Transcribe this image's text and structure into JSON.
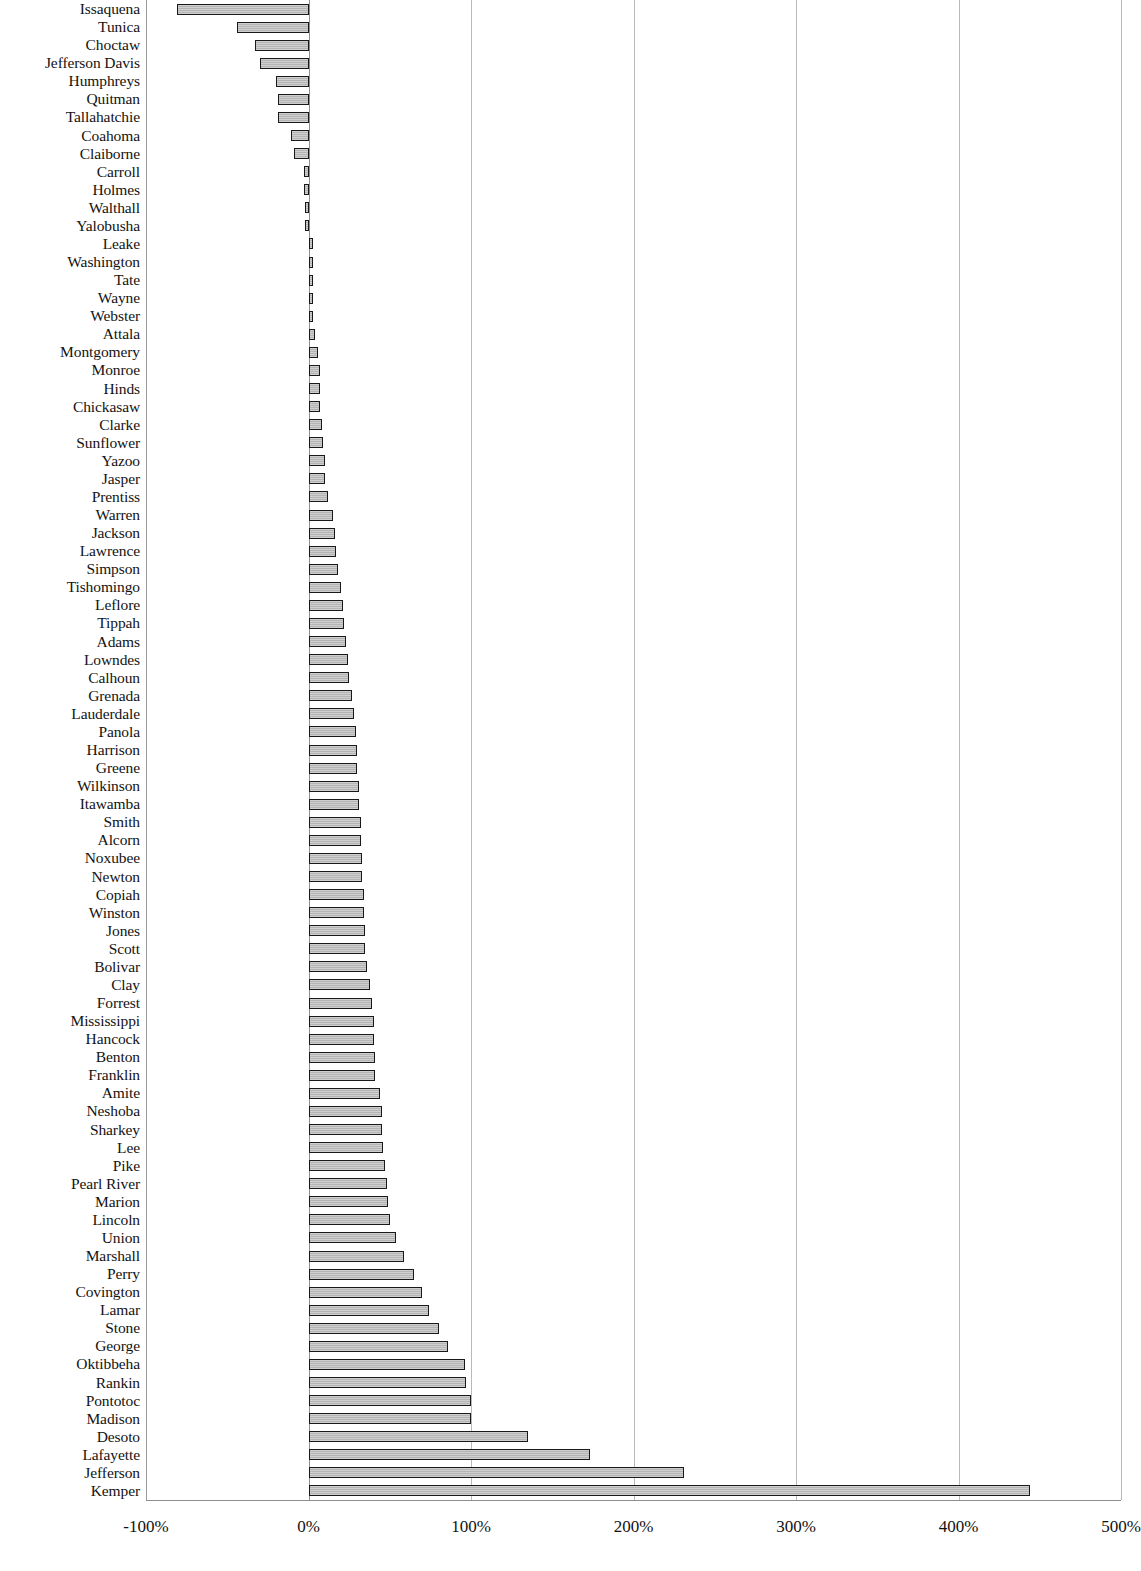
{
  "chart_data": {
    "type": "bar",
    "orientation": "horizontal",
    "title": "",
    "subtitle": "",
    "xlabel": "",
    "ylabel": "",
    "xlim": [
      -100,
      500
    ],
    "ylim": null,
    "grid": true,
    "legend": null,
    "legend_position": "none",
    "xticklabels": [
      "-100%",
      "0%",
      "100%",
      "200%",
      "300%",
      "400%",
      "500%"
    ],
    "xtickvalues": [
      -100,
      0,
      100,
      200,
      300,
      400,
      500
    ],
    "value_unit": "percent",
    "bar_fill_color": "#c4c4c4",
    "bar_edge_color": "#191919",
    "gridline_color": "#b9b9b9",
    "categories": [
      "Issaquena",
      "Tunica",
      "Choctaw",
      "Jefferson Davis",
      "Humphreys",
      "Quitman",
      "Tallahatchie",
      "Coahoma",
      "Claiborne",
      "Carroll",
      "Holmes",
      "Walthall",
      "Yalobusha",
      "Leake",
      "Washington",
      "Tate",
      "Wayne",
      "Webster",
      "Attala",
      "Montgomery",
      "Monroe",
      "Hinds",
      "Chickasaw",
      "Clarke",
      "Sunflower",
      "Yazoo",
      "Jasper",
      "Prentiss",
      "Warren",
      "Jackson",
      "Lawrence",
      "Simpson",
      "Tishomingo",
      "Leflore",
      "Tippah",
      "Adams",
      "Lowndes",
      "Calhoun",
      "Grenada",
      "Lauderdale",
      "Panola",
      "Harrison",
      "Greene",
      "Wilkinson",
      "Itawamba",
      "Smith",
      "Alcorn",
      "Noxubee",
      "Newton",
      "Copiah",
      "Winston",
      "Jones",
      "Scott",
      "Bolivar",
      "Clay",
      "Forrest",
      "Mississippi",
      "Hancock",
      "Benton",
      "Franklin",
      "Amite",
      "Neshoba",
      "Sharkey",
      "Lee",
      "Pike",
      "Pearl River",
      "Marion",
      "Lincoln",
      "Union",
      "Marshall",
      "Perry",
      "Covington",
      "Lamar",
      "Stone",
      "George",
      "Oktibbeha",
      "Rankin",
      "Pontotoc",
      "Madison",
      "Desoto",
      "Lafayette",
      "Jefferson",
      "Kemper"
    ],
    "values": [
      -81,
      -44,
      -33,
      -30,
      -20,
      -19,
      -19,
      -11,
      -9,
      -3,
      -3,
      -2,
      -2,
      1,
      1,
      1,
      1,
      1,
      4,
      6,
      7,
      7,
      7,
      8,
      9,
      10,
      10,
      12,
      15,
      16,
      17,
      18,
      20,
      21,
      22,
      23,
      24,
      25,
      27,
      28,
      29,
      30,
      30,
      31,
      31,
      32,
      32,
      33,
      33,
      34,
      34,
      35,
      35,
      36,
      38,
      39,
      40,
      40,
      41,
      41,
      44,
      45,
      45,
      46,
      47,
      48,
      49,
      50,
      54,
      59,
      65,
      70,
      74,
      80,
      86,
      96,
      97,
      100,
      100,
      135,
      173,
      231,
      444
    ]
  }
}
